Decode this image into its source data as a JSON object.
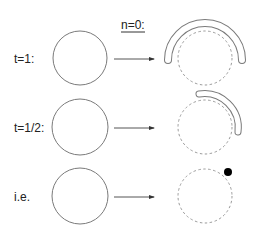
{
  "header": {
    "label": "n=0:"
  },
  "rows": [
    {
      "label": "t=1:"
    },
    {
      "label": "t=1/2:"
    },
    {
      "label": "i.e."
    }
  ],
  "colors": {
    "stroke": "#7a7a7a",
    "dashed": "#9a9a9a",
    "dot": "#000000",
    "text": "#222222"
  }
}
